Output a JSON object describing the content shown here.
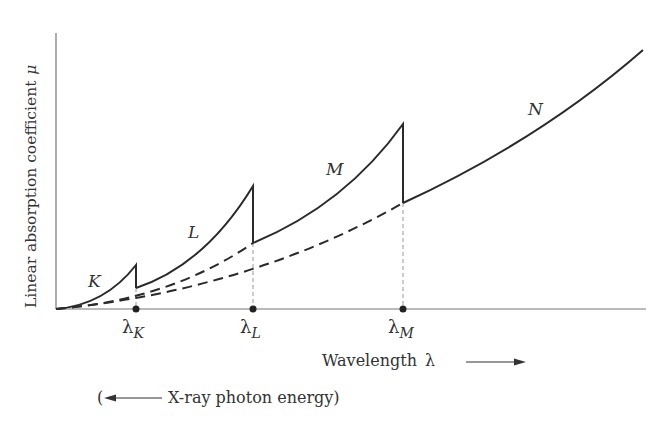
{
  "diagram": {
    "y_axis_label": "Linear absorption coefficient",
    "y_axis_symbol": "μ",
    "x_axis_label": "Wavelength",
    "x_axis_symbol": "λ",
    "secondary_axis_label": "X-ray photon energy",
    "secondary_axis_open": "(",
    "secondary_axis_close": ")",
    "curve_labels": [
      "K",
      "L",
      "M",
      "N"
    ],
    "edges": [
      {
        "symbol": "λ",
        "sub": "K",
        "x": 136
      },
      {
        "symbol": "λ",
        "sub": "L",
        "x": 253
      },
      {
        "symbol": "λ",
        "sub": "M",
        "x": 403
      }
    ],
    "geometry": {
      "origin": [
        56,
        309
      ],
      "y_top": 33,
      "x_right": 643,
      "edge_points": [
        {
          "x": 136,
          "peak_y": 265,
          "drop_y": 288
        },
        {
          "x": 253,
          "peak_y": 186,
          "drop_y": 243
        },
        {
          "x": 403,
          "peak_y": 124,
          "drop_y": 203
        }
      ],
      "end_point": [
        643,
        50
      ]
    },
    "colors": {
      "line": "#2a2a2a",
      "axis": "#555555",
      "guide": "#888888"
    }
  }
}
